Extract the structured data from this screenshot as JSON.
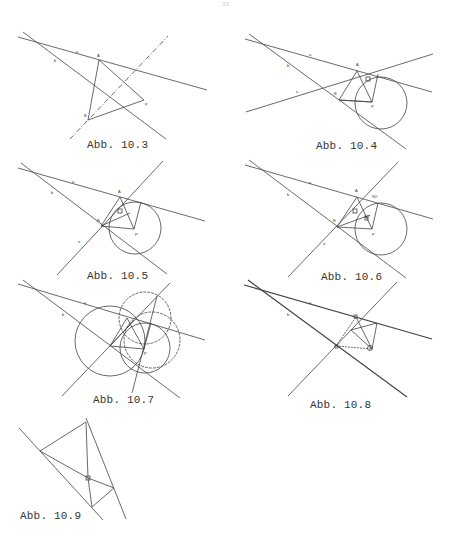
{
  "page": {
    "number": "33"
  },
  "figures": [
    {
      "id": "10.3",
      "caption": "Abb. 10.3",
      "labels": {
        "a": "a",
        "b": "b",
        "A": "A",
        "B": "B",
        "P": "P"
      }
    },
    {
      "id": "10.4",
      "caption": "Abb. 10.4",
      "labels": {
        "a": "a",
        "b": "b",
        "c": "a",
        "A": "A",
        "B": "B",
        "P": "P"
      }
    },
    {
      "id": "10.5",
      "caption": "Abb. 10.5",
      "labels": {
        "a": "a",
        "b": "b",
        "c": "a",
        "A": "A",
        "B": "B",
        "P": "P"
      }
    },
    {
      "id": "10.6",
      "caption": "Abb. 10.6",
      "labels": {
        "a": "a",
        "b": "b",
        "c": "a'",
        "A": "A",
        "B": "B",
        "P": "P",
        "angle1": "90°",
        "angle2": "90°"
      }
    },
    {
      "id": "10.7",
      "caption": "Abb. 10.7",
      "labels": {
        "a": "a",
        "b": "b",
        "P": "P"
      }
    },
    {
      "id": "10.8",
      "caption": "Abb. 10.8",
      "labels": {
        "a": "a",
        "b": "b"
      }
    },
    {
      "id": "10.9",
      "caption": "Abb. 10.9",
      "labels": {}
    }
  ]
}
